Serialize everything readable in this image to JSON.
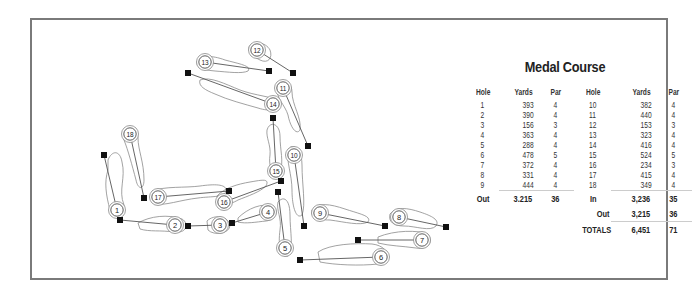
{
  "title": "Medal Course",
  "colors": {
    "frame": "#7a7a7a",
    "line": "#555555",
    "outline": "#888888",
    "tee": "#111111",
    "text": "#222222"
  },
  "scorecard": {
    "headers": [
      "Hole",
      "Yards",
      "Par",
      "Hole",
      "Yards",
      "Par"
    ],
    "front_nine": [
      {
        "hole": "1",
        "yards": "393",
        "par": "4"
      },
      {
        "hole": "2",
        "yards": "390",
        "par": "4"
      },
      {
        "hole": "3",
        "yards": "156",
        "par": "3"
      },
      {
        "hole": "4",
        "yards": "363",
        "par": "4"
      },
      {
        "hole": "5",
        "yards": "288",
        "par": "4"
      },
      {
        "hole": "6",
        "yards": "478",
        "par": "5"
      },
      {
        "hole": "7",
        "yards": "372",
        "par": "4"
      },
      {
        "hole": "8",
        "yards": "331",
        "par": "4"
      },
      {
        "hole": "9",
        "yards": "444",
        "par": "4"
      }
    ],
    "back_nine": [
      {
        "hole": "10",
        "yards": "382",
        "par": "4"
      },
      {
        "hole": "11",
        "yards": "440",
        "par": "4"
      },
      {
        "hole": "12",
        "yards": "153",
        "par": "3"
      },
      {
        "hole": "13",
        "yards": "323",
        "par": "4"
      },
      {
        "hole": "14",
        "yards": "416",
        "par": "4"
      },
      {
        "hole": "15",
        "yards": "524",
        "par": "5"
      },
      {
        "hole": "16",
        "yards": "234",
        "par": "3"
      },
      {
        "hole": "17",
        "yards": "415",
        "par": "4"
      },
      {
        "hole": "18",
        "yards": "349",
        "par": "4"
      }
    ],
    "out": {
      "label": "Out",
      "yards": "3.215",
      "par": "36"
    },
    "in": {
      "label": "In",
      "yards": "3,236",
      "par": "35"
    },
    "out_repeat": {
      "label": "Out",
      "yards": "3,215",
      "par": "36"
    },
    "totals": {
      "label": "TOTALS",
      "yards": "6,451",
      "par": "71"
    }
  },
  "map": {
    "holes": [
      {
        "n": "1",
        "tee": [
          104,
          155
        ],
        "green": [
          117,
          210
        ]
      },
      {
        "n": "2",
        "tee": [
          120,
          220
        ],
        "green": [
          175,
          225
        ]
      },
      {
        "n": "3",
        "tee": [
          188,
          226
        ],
        "green": [
          220,
          225
        ]
      },
      {
        "n": "4",
        "tee": [
          232,
          223
        ],
        "green": [
          268,
          212
        ]
      },
      {
        "n": "5",
        "tee": [
          278,
          192
        ],
        "green": [
          285,
          248
        ]
      },
      {
        "n": "6",
        "tee": [
          300,
          260
        ],
        "green": [
          381,
          257
        ]
      },
      {
        "n": "7",
        "tee": [
          358,
          240
        ],
        "green": [
          422,
          240
        ]
      },
      {
        "n": "8",
        "tee": [
          446,
          227
        ],
        "green": [
          399,
          217
        ]
      },
      {
        "n": "9",
        "tee": [
          385,
          226
        ],
        "green": [
          320,
          213
        ]
      },
      {
        "n": "10",
        "tee": [
          304,
          226
        ],
        "green": [
          294,
          155
        ]
      },
      {
        "n": "11",
        "tee": [
          308,
          146
        ],
        "green": [
          283,
          88
        ]
      },
      {
        "n": "12",
        "tee": [
          293,
          73
        ],
        "green": [
          257,
          50
        ]
      },
      {
        "n": "13",
        "tee": [
          269,
          71
        ],
        "green": [
          205,
          62
        ]
      },
      {
        "n": "14",
        "tee": [
          188,
          73
        ],
        "green": [
          273,
          104
        ]
      },
      {
        "n": "15",
        "tee": [
          273,
          118
        ],
        "green": [
          276,
          171
        ]
      },
      {
        "n": "16",
        "tee": [
          281,
          181
        ],
        "green": [
          224,
          202
        ]
      },
      {
        "n": "17",
        "tee": [
          229,
          191
        ],
        "green": [
          158,
          197
        ]
      },
      {
        "n": "18",
        "tee": [
          144,
          198
        ],
        "green": [
          130,
          134
        ]
      }
    ]
  }
}
